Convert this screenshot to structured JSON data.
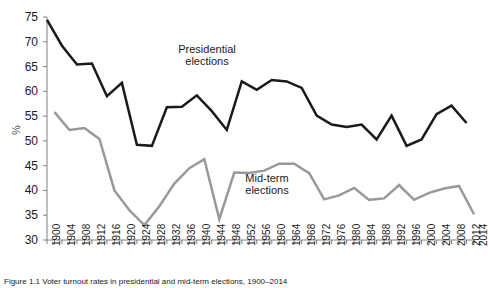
{
  "figure": {
    "ylabel": "%",
    "annotations": [
      {
        "name": "presidential",
        "line1": "Presidential",
        "line2": "elections"
      },
      {
        "name": "midterm",
        "line1": "Mid-term",
        "line2": "elections"
      }
    ],
    "caption": "Figure 1.1  Voter turnout rates in presidential and mid-term elections, 1900–2014"
  },
  "chart_data": {
    "type": "line",
    "title": "",
    "xlabel": "",
    "ylabel": "%",
    "ylim": [
      30,
      75
    ],
    "yticks": [
      30,
      35,
      40,
      45,
      50,
      55,
      60,
      65,
      70,
      75
    ],
    "grid": false,
    "legend": "inline-annotations",
    "xlim": [
      1900,
      2014
    ],
    "xticks": [
      1900,
      1904,
      1908,
      1912,
      1916,
      1920,
      1924,
      1928,
      1932,
      1936,
      1940,
      1944,
      1948,
      1952,
      1956,
      1960,
      1964,
      1968,
      1972,
      1976,
      1980,
      1984,
      1988,
      1992,
      1996,
      2000,
      2004,
      2008,
      2012,
      2014
    ],
    "xtick_labels": [
      "1900",
      "1904",
      "1908",
      "1912",
      "1916",
      "1920",
      "1924",
      "1928",
      "1932",
      "1936",
      "1940",
      "1944",
      "1948",
      "1952",
      "1956",
      "1960",
      "1964",
      "1968",
      "1972",
      "1976",
      "1980",
      "1984",
      "1988",
      "1992",
      "1996",
      "2000",
      "2004",
      "2008",
      "2012",
      "2014"
    ],
    "series": [
      {
        "name": "Presidential elections",
        "color": "#1a1a1a",
        "x": [
          1900,
          1904,
          1908,
          1912,
          1916,
          1920,
          1924,
          1928,
          1932,
          1936,
          1940,
          1944,
          1948,
          1952,
          1956,
          1960,
          1964,
          1968,
          1972,
          1976,
          1980,
          1984,
          1988,
          1992,
          1996,
          2000,
          2004,
          2008,
          2012
        ],
        "values": [
          74.4,
          69.2,
          65.4,
          65.6,
          59.0,
          61.7,
          49.2,
          49.0,
          56.8,
          56.9,
          59.2,
          56.0,
          52.2,
          62.0,
          60.3,
          62.3,
          62.0,
          60.7,
          55.1,
          53.3,
          52.8,
          53.3,
          50.3,
          55.1,
          49.0,
          50.3,
          55.4,
          57.1,
          53.6
        ],
        "style": "solid",
        "width": 2.5
      },
      {
        "name": "Mid-term elections",
        "color": "#999999",
        "x": [
          1902,
          1906,
          1910,
          1914,
          1918,
          1922,
          1926,
          1930,
          1934,
          1938,
          1942,
          1946,
          1950,
          1954,
          1958,
          1962,
          1966,
          1970,
          1974,
          1978,
          1982,
          1986,
          1990,
          1994,
          1998,
          2002,
          2006,
          2010,
          2014
        ],
        "values": [
          55.8,
          52.2,
          52.6,
          50.4,
          40.0,
          36.0,
          33.0,
          36.8,
          41.4,
          44.5,
          46.3,
          34.2,
          43.6,
          43.5,
          44.0,
          45.4,
          45.4,
          43.5,
          38.2,
          39.0,
          40.5,
          38.1,
          38.4,
          41.1,
          38.1,
          39.5,
          40.4,
          40.9,
          35.2
        ],
        "style": "solid",
        "width": 2.5
      }
    ]
  }
}
